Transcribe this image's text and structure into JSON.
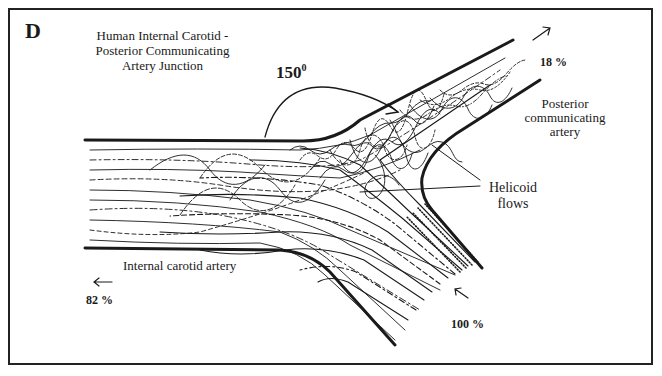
{
  "figure": {
    "panel_letter": "D",
    "title_lines": [
      "Human Internal Carotid -",
      "Posterior Communicating",
      "Artery Junction"
    ],
    "angle": {
      "value": "150",
      "unit": "0"
    },
    "labels": {
      "pcomm": [
        "Posterior",
        "communicating",
        "artery"
      ],
      "helicoid": [
        "Helicoid",
        "flows"
      ],
      "ica": "Internal carotid artery"
    },
    "flows": {
      "outflow_pcomm": {
        "arrow": "↗",
        "percent": "18 %"
      },
      "outflow_ica": {
        "arrow": "←",
        "percent": "82 %"
      },
      "inflow": {
        "arrow": "↖",
        "percent": "100 %"
      }
    },
    "colors": {
      "ink": "#1a1a1a",
      "background": "#ffffff"
    }
  }
}
